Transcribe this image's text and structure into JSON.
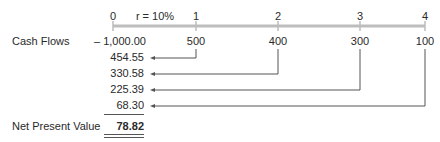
{
  "timeline": {
    "periods": [
      "0",
      "1",
      "2",
      "3",
      "4"
    ],
    "rate_label": "r = 10%",
    "axis_color": "#bdbdbd"
  },
  "cash_flows": {
    "label": "Cash Flows",
    "values": [
      "– 1,000.00",
      "500",
      "400",
      "300",
      "100"
    ]
  },
  "present_values": [
    "454.55",
    "330.58",
    "225.39",
    "68.30"
  ],
  "npv": {
    "label": "Net Present Value",
    "value": "78.82"
  }
}
